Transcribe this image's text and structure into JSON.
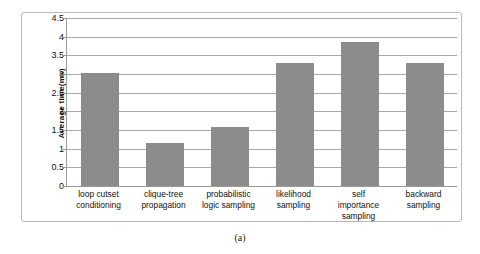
{
  "caption": "(a)",
  "chart_data": {
    "type": "bar",
    "title": "",
    "xlabel": "",
    "ylabel": "Average time(ms)",
    "ylim": [
      0,
      4.5
    ],
    "ytick_labels": [
      "4.5",
      "4",
      "3.5",
      "3",
      "2.5",
      "2",
      "1.5",
      "1",
      "0.5",
      "0"
    ],
    "yticks": [
      4.5,
      4,
      3.5,
      3,
      2.5,
      2,
      1.5,
      1,
      0.5,
      0
    ],
    "grid": true,
    "legend": false,
    "bar_color": "#8c8c8c",
    "categories": [
      "loop cutset conditioning",
      "clique-tree propagation",
      "probabilistic logic sampling",
      "likelihood sampling",
      "self importance sampling",
      "backward sampling"
    ],
    "category_lines": [
      [
        "loop cutset",
        "conditioning"
      ],
      [
        "clique-tree",
        "propagation"
      ],
      [
        "probabilistic",
        "logic sampling"
      ],
      [
        "likelihood",
        "sampling"
      ],
      [
        "self",
        "importance",
        "sampling"
      ],
      [
        "backward",
        "sampling"
      ]
    ],
    "values": [
      3.02,
      1.15,
      1.58,
      3.3,
      3.85,
      3.3
    ]
  }
}
